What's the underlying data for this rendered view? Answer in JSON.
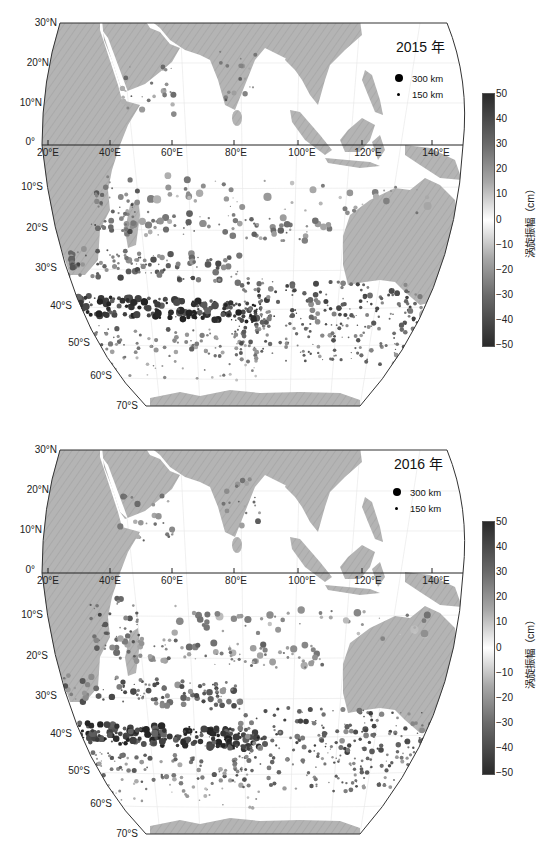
{
  "figure": {
    "colors": {
      "land": "#b4b4b4",
      "ocean": "#ffffff",
      "frame": "#333333",
      "eddy_strong": "#2a2a2a",
      "eddy_weak": "#bdbdbd"
    },
    "lat_labels": [
      "30°N",
      "20°N",
      "10°N",
      "0°",
      "10°S",
      "20°S",
      "30°S",
      "40°S",
      "50°S",
      "60°S",
      "70°S"
    ],
    "lon_labels": [
      "20°E",
      "40°E",
      "60°E",
      "80°E",
      "100°E",
      "120°E",
      "140°E"
    ],
    "legend": {
      "large_label": "300 km",
      "small_label": "150 km"
    },
    "colorbar": {
      "title": "涡旋振幅（cm）",
      "ticks": [
        "50",
        "40",
        "30",
        "20",
        "10",
        "0",
        "−10",
        "−20",
        "−30",
        "−40",
        "−50"
      ],
      "range": [
        -50,
        50
      ]
    },
    "panels": [
      {
        "year_label": "2015 年"
      },
      {
        "year_label": "2016 年"
      }
    ]
  },
  "chart_data": [
    {
      "type": "scatter",
      "title": "2015 年",
      "subtitle": "Mesoscale eddies in the Indian Ocean",
      "xlabel": "Longitude",
      "ylabel": "Latitude",
      "x_range": [
        "20°E",
        "150°E"
      ],
      "y_range": [
        "70°S",
        "30°N"
      ],
      "xticks": [
        "20°E",
        "40°E",
        "60°E",
        "80°E",
        "100°E",
        "120°E",
        "140°E"
      ],
      "yticks": [
        "30°N",
        "20°N",
        "10°N",
        "0°",
        "10°S",
        "20°S",
        "30°S",
        "40°S",
        "50°S",
        "60°S",
        "70°S"
      ],
      "size_legend": [
        "300 km",
        "150 km"
      ],
      "color_variable": "涡旋振幅（cm）",
      "color_range": [
        -50,
        50
      ],
      "grid": true,
      "notes": "Densest/highest-amplitude eddies along 35°S–45°S band from 25°E to 90°E; secondary bands near 25°S and 50°S; scattered eddies in Arabian Sea and Bay of Bengal"
    },
    {
      "type": "scatter",
      "title": "2016 年",
      "subtitle": "Mesoscale eddies in the Indian Ocean",
      "xlabel": "Longitude",
      "ylabel": "Latitude",
      "x_range": [
        "20°E",
        "150°E"
      ],
      "y_range": [
        "70°S",
        "30°N"
      ],
      "xticks": [
        "20°E",
        "40°E",
        "60°E",
        "80°E",
        "100°E",
        "120°E",
        "140°E"
      ],
      "yticks": [
        "30°N",
        "20°N",
        "10°N",
        "0°",
        "10°S",
        "20°S",
        "30°S",
        "40°S",
        "50°S",
        "60°S",
        "70°S"
      ],
      "size_legend": [
        "300 km",
        "150 km"
      ],
      "color_variable": "涡旋振幅（cm）",
      "color_range": [
        -50,
        50
      ],
      "grid": true,
      "notes": "Strong eddy band along 38°S–45°S from 20°E to 90°E; extended band south of Australia 40°S–48°S; scattered eddies in northern Indian Ocean"
    }
  ]
}
